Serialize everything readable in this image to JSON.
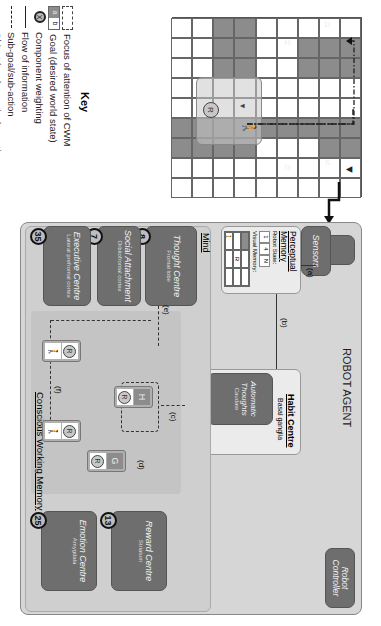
{
  "key": {
    "title": "Key",
    "items": [
      {
        "icon": "dashed-rect-icon",
        "label": "Focus of attention of CWM"
      },
      {
        "icon": "goal-box-icon",
        "symbol_a": "a",
        "symbol_b": "b",
        "label": "Goal (desired world state)"
      },
      {
        "icon": "weighting-circle-icon",
        "symbol": "X",
        "label": "Component weighting"
      },
      {
        "icon": "solid-arrow-icon",
        "label": "Flow of information"
      },
      {
        "icon": "dashed-arrow-icon",
        "label": "Sub-goal/sub-action"
      },
      {
        "icon": "diamond-dashed-arrow-icon",
        "label": "Object (goal or action) creation"
      },
      {
        "icon": "dash-dot-arrow-icon",
        "label": "'Act of kindness' path"
      }
    ]
  },
  "grid": {
    "rows": 9,
    "cols": 9,
    "dark_cells": [
      [
        0,
        1
      ],
      [
        0,
        2
      ],
      [
        0,
        5
      ],
      [
        0,
        6
      ],
      [
        1,
        1
      ],
      [
        1,
        2
      ],
      [
        1,
        5
      ],
      [
        1,
        6
      ],
      [
        2,
        1
      ],
      [
        2,
        2
      ],
      [
        2,
        5
      ],
      [
        3,
        5
      ],
      [
        4,
        5
      ],
      [
        5,
        0
      ],
      [
        5,
        1
      ],
      [
        5,
        2
      ],
      [
        5,
        5
      ],
      [
        5,
        6
      ],
      [
        6,
        0
      ],
      [
        6,
        1
      ],
      [
        6,
        2
      ],
      [
        6,
        5
      ],
      [
        6,
        6
      ],
      [
        7,
        5
      ],
      [
        7,
        6
      ],
      [
        8,
        5
      ],
      [
        8,
        6
      ]
    ],
    "labels": {
      "H": "H",
      "G": "G",
      "D": "D",
      "S": "S"
    },
    "robot_label": "R"
  },
  "agent": {
    "title": "ROBOT AGENT",
    "sensors": "Sensors",
    "robot_controller": "Robot Controller",
    "perceptual_memory": {
      "title": "Perceptual Memory",
      "robot_state_label": "Robot State:",
      "robot_state": [
        "1",
        "4",
        "N"
      ],
      "visual_memory_label": "Visual Memory:",
      "robot_label": "R"
    },
    "habit_centre": {
      "title": "Habit Centre",
      "subtitle": "Basal ganglia",
      "automatic_thoughts": {
        "title": "Automatic Thoughts",
        "region": "Caudate",
        "weight": "5"
      },
      "automatic_actions": {
        "title": "Automatic Actions",
        "region": "Putamen",
        "weight": "7"
      }
    },
    "mind": {
      "title": "Mind",
      "thought_centre": {
        "title": "Thought Centre",
        "region": "Frontal lobe",
        "weight": "8"
      },
      "social_attachment": {
        "title": "Social Attachment",
        "region": "Orbitofrontal cortex",
        "weight": "7"
      },
      "executive_centre": {
        "title": "Executive Centre",
        "region": "Lateral prefrontal cortex",
        "weight": "35"
      },
      "cwm": {
        "title": "Conscious Working Memory"
      },
      "reward_centre": {
        "title": "Reward Centre",
        "region": "Striatum",
        "weight": "13"
      },
      "emotion_centre": {
        "title": "Emotion Centre",
        "region": "Amygdala",
        "weight": "25"
      }
    },
    "arrows": {
      "a": "(a)",
      "b": "(b)",
      "c": "(c)",
      "d": "(d)",
      "e": "(e)",
      "f": "(f)"
    },
    "cwm_items": {
      "goal_h": "H",
      "goal_g": "G",
      "robot": "R"
    }
  }
}
